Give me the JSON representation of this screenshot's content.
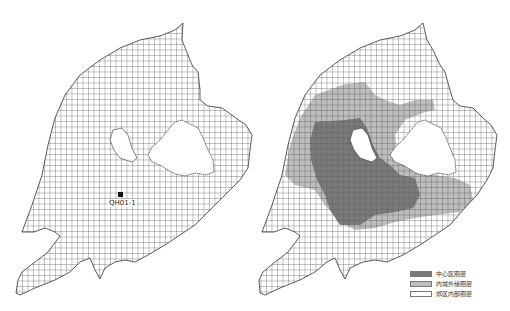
{
  "maps": {
    "left": {
      "point": {
        "id": "QH01-1"
      }
    },
    "right": {
      "legend": {
        "items": [
          {
            "label": "中心区圈层",
            "color": "#7a7a7a"
          },
          {
            "label": "内城外缘圈层",
            "color": "#bdbdbd"
          },
          {
            "label": "郊区内部圈层",
            "color": "#ffffff"
          }
        ]
      }
    }
  },
  "colors": {
    "grid_line": "#444444",
    "outline": "#333333",
    "central_zone": "#7a7a7a",
    "inner_edge_zone": "#bdbdbd",
    "suburban_zone": "#ffffff",
    "point_marker": "#111111"
  }
}
